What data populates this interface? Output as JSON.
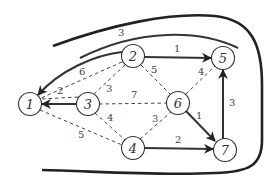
{
  "diagram": {
    "type": "weighted-graph",
    "nodes": [
      {
        "id": "1",
        "label": "1",
        "x": 30,
        "y": 104
      },
      {
        "id": "2",
        "label": "2",
        "x": 133,
        "y": 56
      },
      {
        "id": "3",
        "label": "3",
        "x": 88,
        "y": 104
      },
      {
        "id": "4",
        "label": "4",
        "x": 133,
        "y": 148
      },
      {
        "id": "5",
        "label": "5",
        "x": 223,
        "y": 58
      },
      {
        "id": "6",
        "label": "6",
        "x": 178,
        "y": 103
      },
      {
        "id": "7",
        "label": "7",
        "x": 225,
        "y": 150
      }
    ],
    "edges": [
      {
        "from": "2",
        "to": "1",
        "weight": "3",
        "style": "solid-curved-directed"
      },
      {
        "from": "2",
        "to": "5",
        "weight": "1",
        "style": "solid-directed"
      },
      {
        "from": "3",
        "to": "1",
        "weight": "",
        "style": "solid-directed"
      },
      {
        "from": "2",
        "to": "1",
        "weight": "6",
        "style": "dashed"
      },
      {
        "from": "3",
        "to": "1",
        "weight": "2",
        "style": "dashed"
      },
      {
        "from": "3",
        "to": "2",
        "weight": "3",
        "style": "dashed"
      },
      {
        "from": "2",
        "to": "6",
        "weight": "5",
        "style": "dashed"
      },
      {
        "from": "3",
        "to": "6",
        "weight": "7",
        "style": "dashed"
      },
      {
        "from": "6",
        "to": "5",
        "weight": "4",
        "style": "dashed"
      },
      {
        "from": "3",
        "to": "4",
        "weight": "4",
        "style": "dashed"
      },
      {
        "from": "1",
        "to": "4",
        "weight": "5",
        "style": "dashed"
      },
      {
        "from": "4",
        "to": "6",
        "weight": "3",
        "style": "dashed"
      },
      {
        "from": "6",
        "to": "7",
        "weight": "1",
        "style": "solid-directed"
      },
      {
        "from": "4",
        "to": "7",
        "weight": "2",
        "style": "solid-directed"
      },
      {
        "from": "7",
        "to": "5",
        "weight": "3",
        "style": "solid-directed"
      }
    ],
    "labels": {
      "n1": "1",
      "n2": "2",
      "n3": "3",
      "n4": "4",
      "n5": "5",
      "n6": "6",
      "n7": "7",
      "w_2_1_curve": "3",
      "w_2_5": "1",
      "w_2_1_dash": "6",
      "w_3_1_dash": "2",
      "w_3_2": "3",
      "w_2_6": "5",
      "w_3_6": "7",
      "w_6_5": "4",
      "w_3_4": "4",
      "w_1_4": "5",
      "w_4_6": "3",
      "w_6_7": "1",
      "w_4_7": "2",
      "w_7_5": "3"
    },
    "boundary": "thick open curve enclosing graph (cut boundary)"
  }
}
